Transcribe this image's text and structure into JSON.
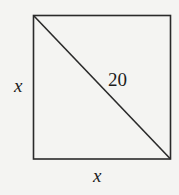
{
  "figure": {
    "shape": "square",
    "diagonal_label": "20",
    "left_side_label": "x",
    "bottom_side_label": "x",
    "stroke_color": "#2a2a2a",
    "background_color": "#f4f4f2"
  }
}
